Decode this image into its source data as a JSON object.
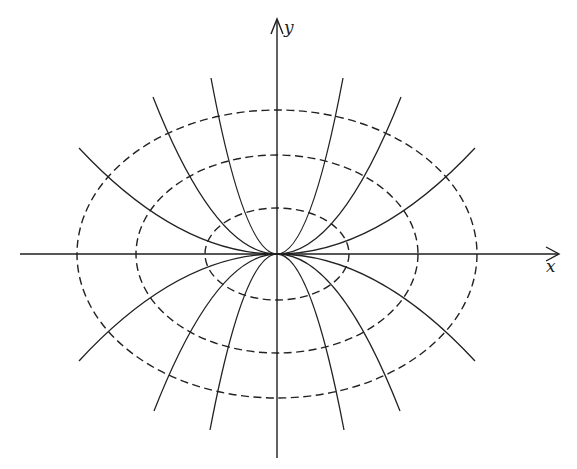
{
  "figure": {
    "axes": {
      "x_label": "x",
      "y_label": "y",
      "origin_px": [
        277,
        254
      ]
    },
    "colors": {
      "ink": "#222222",
      "background": "#ffffff"
    },
    "level_curves": {
      "style": "dashed",
      "shape": "ellipse",
      "equation_form": "x^2 + 2y^2 = c",
      "items": [
        {
          "name": "inner-ellipse",
          "rx": 72,
          "ry": 46
        },
        {
          "name": "middle-ellipse",
          "rx": 141,
          "ry": 99
        },
        {
          "name": "outer-ellipse",
          "rx": 200,
          "ry": 144
        }
      ]
    },
    "trajectories": {
      "style": "solid",
      "shape": "parabola",
      "equation_form": "y = k x^2",
      "items": [
        {
          "name": "steep-upper",
          "half_width": 66,
          "height": 176,
          "direction": "up"
        },
        {
          "name": "medium-upper",
          "half_width": 124,
          "height": 157,
          "direction": "up"
        },
        {
          "name": "shallow-upper",
          "half_width": 198,
          "height": 106,
          "direction": "up"
        },
        {
          "name": "steep-lower",
          "half_width": 67,
          "height": 176,
          "direction": "down"
        },
        {
          "name": "medium-lower",
          "half_width": 123,
          "height": 157,
          "direction": "down"
        },
        {
          "name": "shallow-lower",
          "half_width": 198,
          "height": 107,
          "direction": "down"
        }
      ],
      "includes_y_axis": true
    }
  }
}
